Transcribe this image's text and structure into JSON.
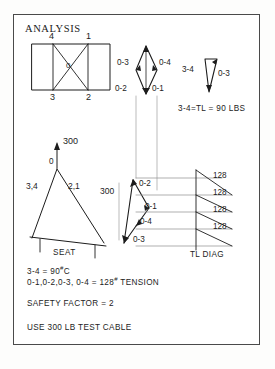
{
  "sheet": {
    "title": "ANALYSIS",
    "border_color": "#4a4a4a",
    "background": "#ffffff",
    "ink_color": "#1c1c1c"
  },
  "plan_view": {
    "name": "rectangle-with-x-bracing",
    "corner_labels": {
      "top_left": "4",
      "top_right": "1",
      "bottom_left": "3",
      "bottom_right": "2"
    },
    "center_label": "0"
  },
  "upper_vector_diamond": {
    "name": "force-diamond-upper",
    "labels": {
      "upper_left": "0-3",
      "upper_right": "0-4",
      "lower_left": "0-2",
      "lower_right": "0-1"
    }
  },
  "small_triangle": {
    "name": "true-length-triangle",
    "labels": {
      "left": "3-4",
      "right": "0-3"
    },
    "result": "3-4=TL = 90 LBS"
  },
  "elevation_view": {
    "name": "seat-elevation-triangle",
    "load_label": "300",
    "apex_label": "0",
    "left_member": "3,4",
    "right_member": "2,1",
    "base_label": "SEAT"
  },
  "lower_vector_polygon": {
    "name": "force-polygon-lower",
    "load_label": "300",
    "labels": {
      "v1": "0-2",
      "v2": "0-1",
      "v3": "0-4",
      "v4": "0-3"
    }
  },
  "tl_diagram": {
    "name": "true-length-diagram",
    "caption": "TL DIAG",
    "rung_values": [
      "128",
      "128",
      "128",
      "128"
    ]
  },
  "notes": [
    {
      "id": "note-compression",
      "text": "3-4 = 90",
      "sup": "#",
      "tail": "C"
    },
    {
      "id": "note-tension",
      "text": "0-1,0-2,0-3, 0-4 = 128",
      "sup": "#",
      "tail": " TENSION"
    },
    {
      "id": "note-safety-factor",
      "text": "SAFETY FACTOR = 2",
      "sup": "",
      "tail": ""
    },
    {
      "id": "note-cable",
      "text": "USE 300 LB  TEST CABLE",
      "sup": "",
      "tail": ""
    }
  ]
}
